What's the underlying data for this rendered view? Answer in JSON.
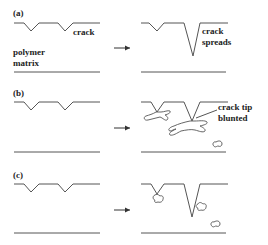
{
  "panels": [
    {
      "id": "a",
      "label": "(a)",
      "left_text": "crack",
      "matrix_label_line1": "polymer",
      "matrix_label_line2": "matrix",
      "right_text_line1": "crack",
      "right_text_line2": "spreads"
    },
    {
      "id": "b",
      "label": "(b)",
      "right_text_line1": "crack tip",
      "right_text_line2": "blunted"
    },
    {
      "id": "c",
      "label": "(c)"
    }
  ],
  "arrow_symbol": "→",
  "colors": {
    "line": "#555555",
    "text": "#222222",
    "background": "#ffffff"
  }
}
